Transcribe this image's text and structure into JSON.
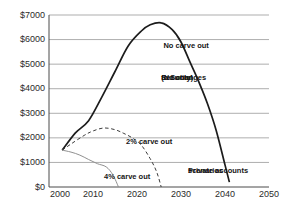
{
  "window": {
    "background": "#ffffff"
  },
  "chart_data": {
    "type": "line",
    "title": "",
    "xlabel": "",
    "ylabel": "",
    "legend": "none (labels are inline annotations)",
    "grid": "horizontal",
    "axis_color": "#4a4a4a",
    "grid_color": "#8a8a8a",
    "x_axis": {
      "min": 2000,
      "max": 2050,
      "ticks": [
        {
          "value": 2000,
          "label": "2000",
          "dx": 11
        },
        {
          "value": 2010,
          "label": "2010",
          "dx": 0
        },
        {
          "value": 2020,
          "label": "2020",
          "dx": 0
        },
        {
          "value": 2030,
          "label": "2030",
          "dx": 0
        },
        {
          "value": 2040,
          "label": "2040",
          "dx": 0
        },
        {
          "value": 2050,
          "label": "2050",
          "dx": 0
        }
      ]
    },
    "y_axis": {
      "min": 0,
      "max": 7000,
      "ticks": [
        {
          "value": 0,
          "label": "$0"
        },
        {
          "value": 1000,
          "label": "$1000"
        },
        {
          "value": 2000,
          "label": "$2000"
        },
        {
          "value": 3000,
          "label": "$3000"
        },
        {
          "value": 4000,
          "label": "$4000"
        },
        {
          "value": 5000,
          "label": "$5000"
        },
        {
          "value": 6000,
          "label": "$6000"
        },
        {
          "value": 7000,
          "label": "$7000"
        }
      ]
    },
    "series": [
      {
        "name": "No carve out",
        "line": "solid",
        "color": "#1c1c1c",
        "width": 1.7,
        "dash": "",
        "points": [
          [
            2003,
            1500
          ],
          [
            2006,
            2200
          ],
          [
            2009,
            2700
          ],
          [
            2012,
            3660
          ],
          [
            2015,
            4700
          ],
          [
            2018,
            5740
          ],
          [
            2021,
            6350
          ],
          [
            2023,
            6600
          ],
          [
            2025.5,
            6680
          ],
          [
            2028,
            6400
          ],
          [
            2030,
            5900
          ],
          [
            2032,
            5100
          ],
          [
            2034,
            4300
          ],
          [
            2036,
            3400
          ],
          [
            2038,
            2300
          ],
          [
            2040,
            900
          ],
          [
            2041,
            200
          ]
        ]
      },
      {
        "name": "2% carve out",
        "line": "dashed",
        "color": "#3c3c3c",
        "width": 1,
        "dash": "3.5 2.6",
        "points": [
          [
            2003,
            1500
          ],
          [
            2005,
            1750
          ],
          [
            2008,
            2100
          ],
          [
            2010,
            2280
          ],
          [
            2012.5,
            2400
          ],
          [
            2015,
            2330
          ],
          [
            2017,
            2180
          ],
          [
            2019,
            1990
          ],
          [
            2021,
            1700
          ],
          [
            2023,
            1150
          ],
          [
            2024.5,
            600
          ],
          [
            2025.5,
            0
          ]
        ]
      },
      {
        "name": "4% carve out",
        "line": "solid",
        "color": "#909090",
        "width": 1,
        "dash": "",
        "points": [
          [
            2003,
            1500
          ],
          [
            2005,
            1420
          ],
          [
            2007,
            1300
          ],
          [
            2009,
            1120
          ],
          [
            2011,
            950
          ],
          [
            2013,
            820
          ],
          [
            2014.5,
            500
          ],
          [
            2015.8,
            0
          ]
        ]
      }
    ],
    "annotations": [
      {
        "id": "no-carve-out-label",
        "lines": [
          "No carve out"
        ],
        "x": 2026,
        "y": 5940
      },
      {
        "id": "no-changes-note",
        "lines": [
          "(No changes",
          "to Social",
          "Security)"
        ],
        "x": 2025.5,
        "y": 4640
      },
      {
        "id": "two-percent-carve-out-label",
        "lines": [
          "2% carve out"
        ],
        "x": 2017.5,
        "y": 2040
      },
      {
        "id": "four-percent-carve-out-label",
        "lines": [
          "4% carve out"
        ],
        "x": 2012.5,
        "y": 610
      },
      {
        "id": "private-accounts-label",
        "lines": [
          "Private accounts",
          "scenarios"
        ],
        "x": 2031.6,
        "y": 860
      }
    ]
  }
}
